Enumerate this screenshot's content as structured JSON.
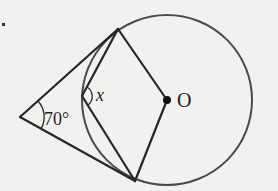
{
  "diagram": {
    "labels": {
      "given_angle": "70°",
      "unknown_angle": "x",
      "center": "O"
    },
    "colors": {
      "background": "#f1f1ef",
      "lines": "#262626",
      "circle": "#4a4a4a"
    },
    "geometry": {
      "circle": {
        "cx": 167,
        "cy": 100,
        "r": 85
      },
      "external_point": {
        "x": 20,
        "y": 117
      },
      "tangent_point_upper": {
        "x": 118,
        "y": 29
      },
      "tangent_point_lower": {
        "x": 135,
        "y": 181
      },
      "arc_point": {
        "x": 82,
        "y": 96
      },
      "center_point": {
        "x": 167,
        "y": 100
      }
    }
  }
}
